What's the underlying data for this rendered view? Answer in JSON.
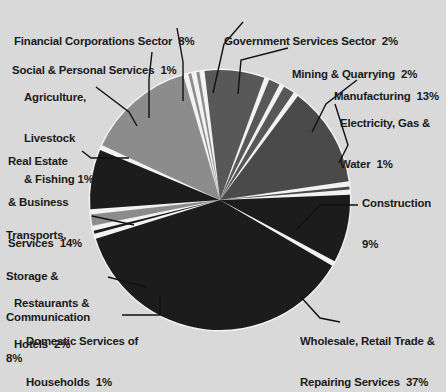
{
  "chart_data": {
    "type": "pie",
    "title": "",
    "subtitle": "",
    "xlabel": "",
    "ylabel": "",
    "legend_position": "none",
    "grid": false,
    "units": "percent",
    "start_angle_deg": 352,
    "direction": "clockwise",
    "categories": [
      "Financial Corporations Sector",
      "Government Services Sector",
      "Mining & Quarrying",
      "Manufacturing",
      "Electricity, Gas & Water",
      "Construction",
      "Wholesale, Retail Trade & Repairing Services",
      "Domestic Services of Households",
      "Restaurants & Hotels",
      "Transports, Storage & Communication",
      "Real Estate & Business Services",
      "Agriculture, Livestock & Fishing",
      "Social & Personal Services"
    ],
    "values": [
      8,
      2,
      2,
      13,
      1,
      9,
      37,
      1,
      2,
      8,
      14,
      1,
      1
    ],
    "colors": [
      "#585858",
      "#585858",
      "#585858",
      "#4a4a4a",
      "#4a4a4a",
      "#1c1c1c",
      "#1c1c1c",
      "#1c1c1c",
      "#8c8c8c",
      "#1c1c1c",
      "#8c8c8c",
      "#8c8c8c",
      "#8c8c8c"
    ]
  },
  "slices": [
    {
      "id": "financial-corporations-sector",
      "label_lines": [
        "Financial Corporations Sector  8%"
      ],
      "value": 8,
      "color": "#585858"
    },
    {
      "id": "government-services-sector",
      "label_lines": [
        "Government Services Sector  2%"
      ],
      "value": 2,
      "color": "#585858"
    },
    {
      "id": "mining-and-quarrying",
      "label_lines": [
        "Mining & Quarrying  2%"
      ],
      "value": 2,
      "color": "#585858"
    },
    {
      "id": "manufacturing",
      "label_lines": [
        "Manufacturing  13%"
      ],
      "value": 13,
      "color": "#4a4a4a"
    },
    {
      "id": "electricity-gas-and-water",
      "label_lines": [
        "Electricity, Gas &",
        "Water  1%"
      ],
      "value": 1,
      "color": "#4a4a4a"
    },
    {
      "id": "construction",
      "label_lines": [
        "Construction",
        "9%"
      ],
      "value": 9,
      "color": "#1c1c1c"
    },
    {
      "id": "wholesale-retail-trade-and-repairing-services",
      "label_lines": [
        "Wholesale, Retail Trade &",
        "Repairing Services  37%"
      ],
      "value": 37,
      "color": "#1c1c1c"
    },
    {
      "id": "domestic-services-of-households",
      "label_lines": [
        "Domestic Services of",
        "Households  1%"
      ],
      "value": 1,
      "color": "#1c1c1c"
    },
    {
      "id": "restaurants-and-hotels",
      "label_lines": [
        "Restaurants &",
        "Hotels  2%"
      ],
      "value": 2,
      "color": "#8c8c8c"
    },
    {
      "id": "transports-storage-and-communication",
      "label_lines": [
        "Transports,",
        "Storage &",
        "Communication",
        "8%"
      ],
      "value": 8,
      "color": "#1c1c1c"
    },
    {
      "id": "real-estate-and-business-services",
      "label_lines": [
        "Real Estate",
        "& Business",
        "Services  14%"
      ],
      "value": 14,
      "color": "#8c8c8c"
    },
    {
      "id": "agriculture-livestock-and-fishing",
      "label_lines": [
        "Agriculture,",
        "Livestock",
        "& Fishing 1%"
      ],
      "value": 1,
      "color": "#8c8c8c"
    },
    {
      "id": "social-and-personal-services",
      "label_lines": [
        "Social & Personal Services  1%"
      ],
      "value": 1,
      "color": "#8c8c8c"
    }
  ],
  "labels": {
    "financial_corporations": "Financial Corporations Sector  8%",
    "government_services": "Government Services Sector  2%",
    "social_personal": "Social & Personal Services  1%",
    "mining_quarrying": "Mining & Quarrying  2%",
    "agriculture_l1": "Agriculture,",
    "agriculture_l2": "Livestock",
    "agriculture_l3": "& Fishing 1%",
    "manufacturing": "Manufacturing  13%",
    "electricity_l1": "Electricity, Gas &",
    "electricity_l2": "Water  1%",
    "real_estate_l1": "Real Estate",
    "real_estate_l2": "& Business",
    "real_estate_l3": "Services  14%",
    "construction_l1": "Construction",
    "construction_l2": "9%",
    "transports_l1": "Transports,",
    "transports_l2": "Storage &",
    "transports_l3": "Communication",
    "transports_l4": "8%",
    "restaurants_l1": "Restaurants &",
    "restaurants_l2": "Hotels  2%",
    "domestic_l1": "Domestic Services of",
    "domestic_l2": "Households  1%",
    "wholesale_l1": "Wholesale, Retail Trade &",
    "wholesale_l2": "Repairing Services  37%"
  },
  "style": {
    "background": "#d9d9d9",
    "separator": "#f2f2f2",
    "text": "#1a1a1a",
    "leader_line": "#111111"
  }
}
